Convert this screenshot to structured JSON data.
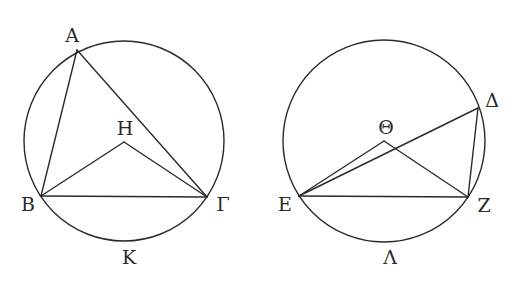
{
  "figure": {
    "left": {
      "circle": {
        "cx": 124,
        "cy": 141,
        "r": 100
      },
      "points": {
        "A": {
          "x": 77,
          "y": 50,
          "label": "Α",
          "lx": 72,
          "ly": 37
        },
        "B": {
          "x": 41,
          "y": 196,
          "label": "Β",
          "lx": 28,
          "ly": 206
        },
        "G": {
          "x": 207,
          "y": 197,
          "label": "Γ",
          "lx": 223,
          "ly": 206
        },
        "H": {
          "x": 124,
          "y": 142,
          "label": "Η",
          "lx": 125,
          "ly": 130
        },
        "K": {
          "label": "Κ",
          "lx": 129,
          "ly": 259
        }
      },
      "segments": [
        [
          "A",
          "B"
        ],
        [
          "A",
          "G"
        ],
        [
          "B",
          "G"
        ],
        [
          "B",
          "H"
        ],
        [
          "H",
          "G"
        ]
      ]
    },
    "right": {
      "circle": {
        "cx": 384,
        "cy": 141,
        "r": 101
      },
      "points": {
        "D": {
          "x": 478,
          "y": 108,
          "label": "Δ",
          "lx": 492,
          "ly": 102
        },
        "TH": {
          "x": 384,
          "y": 141,
          "label": "Θ",
          "lx": 386,
          "ly": 129
        },
        "E": {
          "x": 299,
          "y": 196,
          "label": "Ε",
          "lx": 285,
          "ly": 206
        },
        "Z": {
          "x": 468,
          "y": 197,
          "label": "Ζ",
          "lx": 484,
          "ly": 207
        },
        "L": {
          "label": "Λ",
          "lx": 390,
          "ly": 259
        }
      },
      "segments": [
        [
          "E",
          "Z"
        ],
        [
          "E",
          "D"
        ],
        [
          "D",
          "Z"
        ],
        [
          "E",
          "TH"
        ],
        [
          "TH",
          "Z"
        ]
      ]
    }
  },
  "stroke_color": "#2a2a2a",
  "background_color": "#ffffff"
}
